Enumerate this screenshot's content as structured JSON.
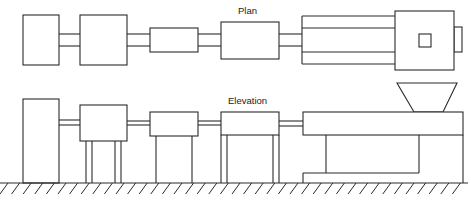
{
  "diagram": {
    "type": "machine-layout",
    "views": [
      {
        "id": "plan",
        "label": "Plan"
      },
      {
        "id": "elevation",
        "label": "Elevation"
      }
    ],
    "plan": {
      "label": "Plan",
      "units": [
        {
          "name": "unit-1",
          "x": 23,
          "y": 15,
          "w": 36,
          "h": 50
        },
        {
          "name": "unit-2",
          "x": 80,
          "y": 15,
          "w": 47,
          "h": 50
        },
        {
          "name": "unit-3",
          "x": 150,
          "y": 28,
          "w": 48,
          "h": 24
        },
        {
          "name": "unit-4",
          "x": 221,
          "y": 22,
          "w": 58,
          "h": 37
        },
        {
          "name": "extruder-cylinder",
          "x": 302,
          "y": 16,
          "w": 93,
          "h": 48
        },
        {
          "name": "extruder-head",
          "x": 395,
          "y": 11,
          "w": 59,
          "h": 59
        },
        {
          "name": "hopper-opening",
          "x": 419,
          "y": 34,
          "w": 12,
          "h": 13
        },
        {
          "name": "end-nub",
          "x": 454,
          "y": 27,
          "w": 8,
          "h": 25
        }
      ]
    },
    "elevation": {
      "label": "Elevation",
      "ground_y": 183
    }
  }
}
